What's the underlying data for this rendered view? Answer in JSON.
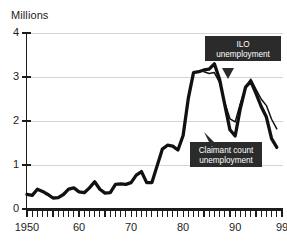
{
  "chart_data": {
    "type": "line",
    "title": "Millions",
    "xlabel": "",
    "ylabel": "Millions",
    "xlim": [
      1950,
      1999
    ],
    "ylim": [
      0,
      4
    ],
    "yticks": [
      "0",
      "1",
      "2",
      "3",
      "4"
    ],
    "ytick_values": [
      0,
      1,
      2,
      3,
      4
    ],
    "xticks": [
      "1950",
      "60",
      "70",
      "80",
      "90",
      "99"
    ],
    "xtick_values": [
      1950,
      1960,
      1970,
      1980,
      1990,
      1999
    ],
    "grid": "horizontal",
    "legend": "none",
    "annotations": [
      {
        "name": "ilo-unemployment",
        "line1": "ILO",
        "line2": "unemployment",
        "points_to_year": 1993,
        "points_to_value": 3.0
      },
      {
        "name": "claimant-count-unemployment",
        "line1": "Claimant count",
        "line2": "unemployment",
        "points_to_year": 1990,
        "points_to_value": 1.65
      }
    ],
    "series": [
      {
        "name": "Claimant count unemployment",
        "style": "thick",
        "x": [
          1950,
          1951,
          1952,
          1953,
          1954,
          1955,
          1956,
          1957,
          1958,
          1959,
          1960,
          1961,
          1962,
          1963,
          1964,
          1965,
          1966,
          1967,
          1968,
          1969,
          1970,
          1971,
          1972,
          1973,
          1974,
          1975,
          1976,
          1977,
          1978,
          1979,
          1980,
          1981,
          1982,
          1983,
          1984,
          1985,
          1986,
          1987,
          1988,
          1989,
          1990,
          1991,
          1992,
          1993,
          1994,
          1995,
          1996,
          1997,
          1998
        ],
        "values": [
          0.33,
          0.31,
          0.45,
          0.4,
          0.33,
          0.25,
          0.26,
          0.33,
          0.45,
          0.48,
          0.39,
          0.37,
          0.48,
          0.62,
          0.45,
          0.36,
          0.37,
          0.56,
          0.57,
          0.56,
          0.6,
          0.77,
          0.85,
          0.6,
          0.6,
          0.98,
          1.36,
          1.45,
          1.43,
          1.34,
          1.67,
          2.52,
          3.1,
          3.12,
          3.16,
          3.18,
          3.3,
          2.95,
          2.37,
          1.8,
          1.66,
          2.29,
          2.77,
          2.9,
          2.63,
          2.33,
          2.09,
          1.6,
          1.4
        ]
      },
      {
        "name": "ILO unemployment",
        "style": "thin",
        "x": [
          1984,
          1985,
          1986,
          1987,
          1988,
          1989,
          1990,
          1991,
          1992,
          1993,
          1994,
          1995,
          1996,
          1997,
          1998
        ],
        "values": [
          3.12,
          3.08,
          3.1,
          2.88,
          2.42,
          2.05,
          1.98,
          2.4,
          2.77,
          2.95,
          2.72,
          2.5,
          2.35,
          2.04,
          1.82
        ]
      }
    ]
  }
}
